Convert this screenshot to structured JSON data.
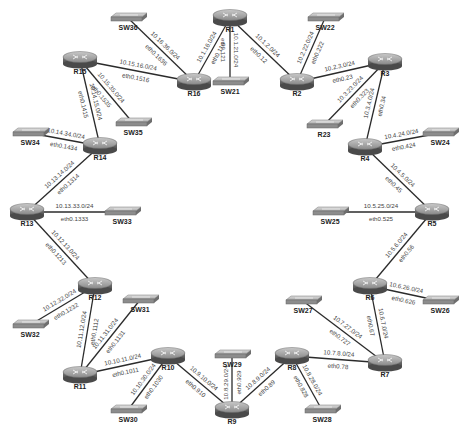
{
  "diagram": {
    "title": "",
    "nodes": [
      {
        "id": "R1",
        "type": "router"
      },
      {
        "id": "R2",
        "type": "router"
      },
      {
        "id": "R3",
        "type": "router"
      },
      {
        "id": "R4",
        "type": "router"
      },
      {
        "id": "R5",
        "type": "router"
      },
      {
        "id": "R6",
        "type": "router"
      },
      {
        "id": "R7",
        "type": "router"
      },
      {
        "id": "R8",
        "type": "router"
      },
      {
        "id": "R9",
        "type": "router"
      },
      {
        "id": "R10",
        "type": "router"
      },
      {
        "id": "R11",
        "type": "router"
      },
      {
        "id": "R12",
        "type": "router"
      },
      {
        "id": "R13",
        "type": "router"
      },
      {
        "id": "R14",
        "type": "router"
      },
      {
        "id": "R15",
        "type": "router"
      },
      {
        "id": "R16",
        "type": "router"
      },
      {
        "id": "R23",
        "type": "switch"
      },
      {
        "id": "SW21",
        "type": "switch"
      },
      {
        "id": "SW22",
        "type": "switch"
      },
      {
        "id": "SW24",
        "type": "switch"
      },
      {
        "id": "SW25",
        "type": "switch"
      },
      {
        "id": "SW26",
        "type": "switch"
      },
      {
        "id": "SW27",
        "type": "switch"
      },
      {
        "id": "SW28",
        "type": "switch"
      },
      {
        "id": "SW29",
        "type": "switch"
      },
      {
        "id": "SW30",
        "type": "switch"
      },
      {
        "id": "SW31",
        "type": "switch"
      },
      {
        "id": "SW32",
        "type": "switch"
      },
      {
        "id": "SW33",
        "type": "switch"
      },
      {
        "id": "SW34",
        "type": "switch"
      },
      {
        "id": "SW35",
        "type": "switch"
      },
      {
        "id": "SW36",
        "type": "switch"
      }
    ],
    "links": [
      {
        "from": "R1",
        "to": "R16",
        "subnet": "10.1.16.0/24",
        "iface": "eth0.116"
      },
      {
        "from": "R1",
        "to": "SW21",
        "subnet": "10.1.21.0/24",
        "iface": "eth0.121"
      },
      {
        "from": "R1",
        "to": "R2",
        "subnet": "10.1.2.0/24",
        "iface": "eth0.12"
      },
      {
        "from": "R2",
        "to": "SW22",
        "subnet": "10.2.22.0/24",
        "iface": "eth0.222"
      },
      {
        "from": "R2",
        "to": "R3",
        "subnet": "10.2.3.0/24",
        "iface": "eth0.23"
      },
      {
        "from": "R3",
        "to": "R23",
        "subnet": "10.3.23.0/24",
        "iface": "eth0.323"
      },
      {
        "from": "R3",
        "to": "R4",
        "subnet": "10.3.4.0/24",
        "iface": "eth0.34"
      },
      {
        "from": "R4",
        "to": "SW24",
        "subnet": "10.4.24.0/24",
        "iface": "eth0.424"
      },
      {
        "from": "R4",
        "to": "R5",
        "subnet": "10.4.5.0/24",
        "iface": "eth0.45"
      },
      {
        "from": "R5",
        "to": "SW25",
        "subnet": "10.5.25.0/24",
        "iface": "eth0.525"
      },
      {
        "from": "R5",
        "to": "R6",
        "subnet": "10.5.6.0/24",
        "iface": "eth0.56"
      },
      {
        "from": "R6",
        "to": "SW26",
        "subnet": "10.6.26.0/24",
        "iface": "eth0.626"
      },
      {
        "from": "R6",
        "to": "R7",
        "subnet": "10.6.7.0/24",
        "iface": "eth0.67"
      },
      {
        "from": "R7",
        "to": "SW27",
        "subnet": "10.7.27.0/24",
        "iface": "eth0.727"
      },
      {
        "from": "R7",
        "to": "R8",
        "subnet": "10.7.8.0/24",
        "iface": "eth0.78"
      },
      {
        "from": "R8",
        "to": "SW28",
        "subnet": "10.8.28.0/24",
        "iface": "eth0.828"
      },
      {
        "from": "R8",
        "to": "R9",
        "subnet": "10.8.9.0/24",
        "iface": "eth0.89"
      },
      {
        "from": "R9",
        "to": "SW29",
        "subnet": "10.8.29.0/24",
        "iface": "eth0.929"
      },
      {
        "from": "R9",
        "to": "R10",
        "subnet": "10.9.10.0/24",
        "iface": "eth0.910"
      },
      {
        "from": "R10",
        "to": "SW30",
        "subnet": "10.10.30.0/24",
        "iface": "eth0.1030"
      },
      {
        "from": "R10",
        "to": "R11",
        "subnet": "10.10.11.0/24",
        "iface": "eth0.1011"
      },
      {
        "from": "R11",
        "to": "SW31",
        "subnet": "10.11.31.0/24",
        "iface": "eth0.1131"
      },
      {
        "from": "R11",
        "to": "R12",
        "subnet": "10.11.12.0/24",
        "iface": "eth0.1112"
      },
      {
        "from": "R12",
        "to": "SW32",
        "subnet": "10.12.32.0/24",
        "iface": "eth0.1232"
      },
      {
        "from": "R12",
        "to": "R13",
        "subnet": "10.12.13.0/24",
        "iface": "eth0.1213"
      },
      {
        "from": "R13",
        "to": "SW33",
        "subnet": "10.13.33.0/24",
        "iface": "eth0.1333"
      },
      {
        "from": "R13",
        "to": "R14",
        "subnet": "10.13.14.0/24",
        "iface": "eth0.1314"
      },
      {
        "from": "R14",
        "to": "SW34",
        "subnet": "10.14.34.0/24",
        "iface": "eth0.1434"
      },
      {
        "from": "R14",
        "to": "R15",
        "subnet": "10.14.15.0/24",
        "iface": "eth0.1415"
      },
      {
        "from": "R15",
        "to": "SW35",
        "subnet": "10.15.35.0/24",
        "iface": "eth0.1535"
      },
      {
        "from": "R15",
        "to": "R16",
        "subnet": "10.15.16.0/24",
        "iface": "eth0.1516"
      },
      {
        "from": "R16",
        "to": "SW36",
        "subnet": "10.16.36.0/24",
        "iface": "eth0.1636"
      }
    ]
  }
}
